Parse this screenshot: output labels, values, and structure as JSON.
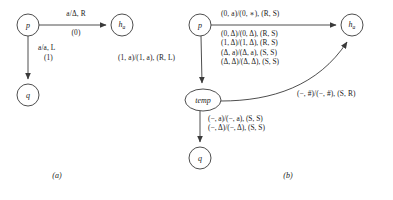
{
  "figure": {
    "title_a_caption": "(a)",
    "title_b_caption": "(b)"
  },
  "diagram_a": {
    "caption": "(a)",
    "nodes": [
      {
        "id": "p",
        "label": "p",
        "sub": "",
        "x": 28,
        "y": 25,
        "rx": 11,
        "ry": 11
      },
      {
        "id": "ha",
        "label": "h",
        "sub": "a",
        "x": 122,
        "y": 25,
        "rx": 11,
        "ry": 11
      },
      {
        "id": "q",
        "label": "q",
        "sub": "",
        "x": 28,
        "y": 95,
        "rx": 11,
        "ry": 11
      }
    ],
    "edges": [
      {
        "from": "p",
        "to": "ha",
        "label_above": "a/Δ, R",
        "label_below": "(0)"
      },
      {
        "from": "p",
        "to": "q",
        "label_line1": "a/a, L",
        "label_line2": "(1)"
      }
    ]
  },
  "diagram_b": {
    "caption": "(b)",
    "nodes": [
      {
        "id": "p",
        "label": "p",
        "sub": "",
        "x": 200,
        "y": 25,
        "rx": 11,
        "ry": 11
      },
      {
        "id": "ha",
        "label": "h",
        "sub": "a",
        "x": 352,
        "y": 25,
        "rx": 11,
        "ry": 11
      },
      {
        "id": "temp",
        "label": "temp",
        "sub": "",
        "x": 203,
        "y": 100,
        "rx": 18,
        "ry": 11
      },
      {
        "id": "q",
        "label": "q",
        "sub": "",
        "x": 200,
        "y": 158,
        "rx": 11,
        "ry": 11
      }
    ],
    "edge_p_to_ha": {
      "label": "(0, a)/(0, ∗), (R, S)"
    },
    "edge_p_to_temp": {
      "label": "(1, a)/(1, a), (R, L)",
      "stacked_labels": [
        "(0, Δ)/(0, Δ), (R, S)",
        "(1, Δ)/(1, Δ), (R, S)",
        "(Δ, a)/(Δ, a), (S, S)",
        "(Δ, Δ)/(Δ, Δ), (S, S)"
      ]
    },
    "edge_temp_to_ha": {
      "label": "(−, #)/(−, #), (S, R)"
    },
    "edge_temp_to_q": {
      "labels": [
        "(−, a)/(−, a), (S, S)",
        "(−, Δ)/(−, Δ), (S, S)"
      ]
    }
  },
  "colors": {
    "stroke": "#3a3a3a",
    "text": "#1a1a1a",
    "background": "#ffffff"
  }
}
